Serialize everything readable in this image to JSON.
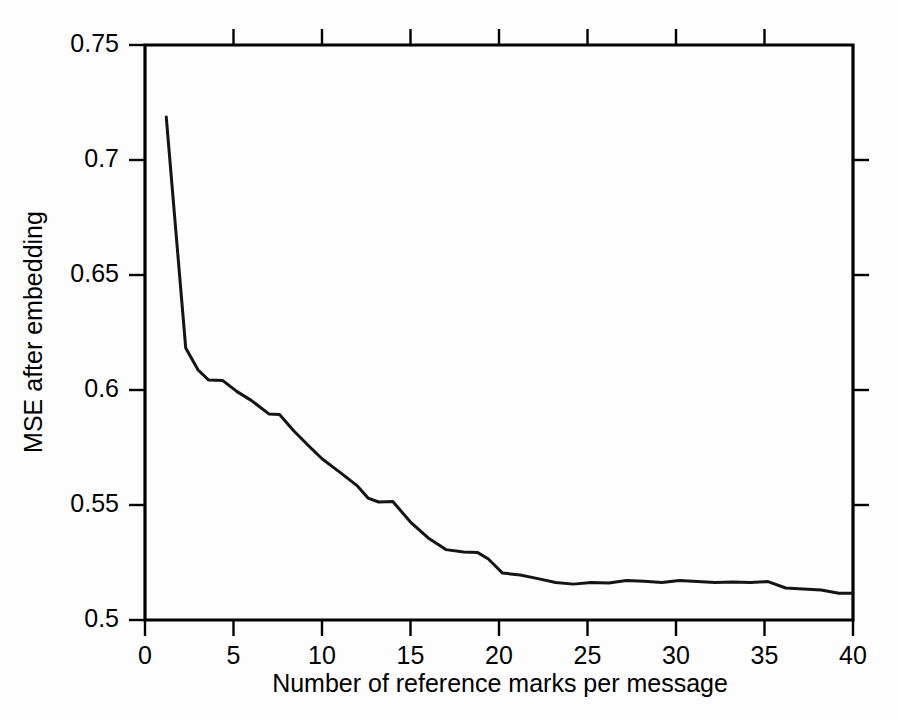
{
  "chart_data": {
    "type": "line",
    "title": "",
    "xlabel": "Number of reference marks per message",
    "ylabel": "MSE after embedding",
    "xlim": [
      0,
      40
    ],
    "ylim": [
      0.5,
      0.75
    ],
    "grid": false,
    "legend": null,
    "x_ticks": [
      0,
      5,
      10,
      15,
      20,
      25,
      30,
      35,
      40
    ],
    "x_tick_labels": [
      "0",
      "5",
      "10",
      "15",
      "20",
      "25",
      "30",
      "35",
      "40"
    ],
    "y_ticks": [
      0.5,
      0.55,
      0.6,
      0.65,
      0.7,
      0.75
    ],
    "y_tick_labels": [
      "0.5",
      "0.55",
      "0.6",
      "0.65",
      "0.7",
      "0.75"
    ],
    "line_color": "#141414",
    "series": [
      {
        "name": "MSE after embedding",
        "x": [
          1.2,
          2.3,
          3.0,
          3.6,
          4.4,
          5.2,
          6.0,
          7.0,
          7.6,
          8.4,
          9.2,
          10.0,
          11.0,
          12.0,
          12.6,
          13.2,
          14.0,
          15.0,
          16.0,
          17.0,
          18.0,
          18.8,
          19.4,
          20.2,
          21.2,
          22.2,
          23.2,
          24.2,
          25.2,
          26.2,
          27.2,
          28.2,
          29.2,
          30.2,
          31.2,
          32.2,
          33.2,
          34.2,
          35.2,
          36.2,
          37.2,
          38.2,
          39.2,
          40.0
        ],
        "y": [
          0.7187,
          0.6183,
          0.6087,
          0.6043,
          0.6041,
          0.5993,
          0.5955,
          0.5896,
          0.5893,
          0.5823,
          0.5761,
          0.5701,
          0.5643,
          0.5583,
          0.553,
          0.5513,
          0.5515,
          0.5426,
          0.5357,
          0.5306,
          0.5296,
          0.5293,
          0.5265,
          0.5204,
          0.5196,
          0.518,
          0.5163,
          0.5156,
          0.5163,
          0.5161,
          0.5172,
          0.5168,
          0.5163,
          0.5172,
          0.5167,
          0.5163,
          0.5165,
          0.5163,
          0.5167,
          0.5139,
          0.5135,
          0.513,
          0.5116,
          0.5116
        ]
      }
    ]
  }
}
